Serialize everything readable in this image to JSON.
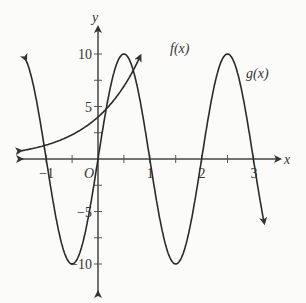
{
  "chart_data": {
    "type": "line",
    "title": "",
    "xlabel": "x",
    "ylabel": "y",
    "origin_label": "O",
    "xlim": [
      -1.5,
      3.3
    ],
    "ylim": [
      -12,
      12
    ],
    "x_ticks": [
      -1,
      0,
      1,
      2,
      3
    ],
    "x_tick_labels": [
      "−1",
      "",
      "1",
      "2",
      "3"
    ],
    "y_ticks": [
      -10,
      -5,
      5,
      10
    ],
    "y_tick_labels": [
      "−10",
      "−5",
      "5",
      "10"
    ],
    "grid": false,
    "series": [
      {
        "name": "f(x)",
        "label": "f(x)",
        "formula": "4*3^x",
        "x": [
          -1.5,
          -1,
          -0.5,
          0,
          0.5,
          0.8
        ],
        "values": [
          0.77,
          1.33,
          2.31,
          4,
          6.93,
          9.6
        ]
      },
      {
        "name": "g(x)",
        "label": "g(x)",
        "formula": "10*sin(pi*x)",
        "x": [
          -1.4,
          -1,
          -0.5,
          0,
          0.5,
          1,
          1.5,
          2,
          2.5,
          3,
          3.2
        ],
        "values": [
          9.5,
          0,
          -10,
          0,
          10,
          0,
          -10,
          0,
          10,
          0,
          -5.9
        ]
      }
    ]
  },
  "labels": {
    "x_axis": "x",
    "y_axis": "y",
    "origin": "O",
    "f": "f(x)",
    "g": "g(x)"
  }
}
